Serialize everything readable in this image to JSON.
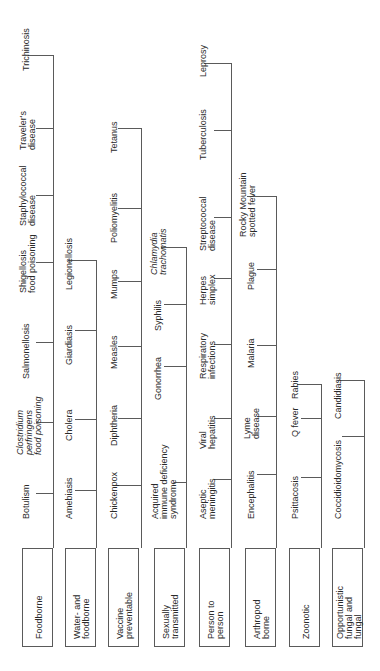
{
  "diagram": {
    "orientation": "rotated-90-ccw",
    "line_color": "#5a5a5a",
    "categories": [
      {
        "label": "Foodborne",
        "diseases": [
          "Botulism",
          "Clostridium\nperfringens\nfood poisoning",
          "Salmonellosis",
          "Shigellosis\nfood poisoning",
          "Staphylococcal\ndisease",
          "Traveler's\ndisease",
          "Trichinosis"
        ]
      },
      {
        "label": "Water- and\nfoodborne",
        "diseases": [
          "Amebiasis",
          "Cholera",
          "Giardiasis",
          "Legionellosis"
        ]
      },
      {
        "label": "Vaccine\npreventable",
        "diseases": [
          "Chickenpox",
          "Diphtheria",
          "Measles",
          "Mumps",
          "Poliomyelitis",
          "Tetanus"
        ]
      },
      {
        "label": "Sexually\ntransmitted",
        "diseases": [
          "Acquired\nimmune deficiency\nsyndrome",
          "Gonorrhea",
          "Syphilis",
          "Chlamydia\ntrachomatis"
        ]
      },
      {
        "label": "Person to\nperson",
        "diseases": [
          "Aseptic\nmeningitis",
          "Viral\nhepatitis",
          "Respiratory\ninfections",
          "Herpes\nsimplex",
          "Streptococcal\ndisease",
          "Tuberculosis",
          "Leprosy"
        ]
      },
      {
        "label": "Arthropod\nborne",
        "diseases": [
          "Encephalitis",
          "Lyme\ndisease",
          "Malaria",
          "Plague",
          "Rocky Mountain\nspotted fever"
        ]
      },
      {
        "label": "Zoonotic",
        "diseases": [
          "Psittacosis",
          "Q fever",
          "Rabies"
        ]
      },
      {
        "label": "Opportunistic\nfungal and\nfungal",
        "diseases": [
          "Coccidioidomycosis",
          "Candidiasis"
        ]
      }
    ]
  }
}
